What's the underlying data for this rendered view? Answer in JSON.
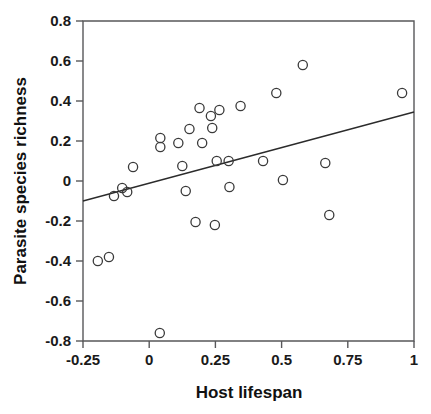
{
  "chart_data": {
    "type": "scatter",
    "title": "",
    "xlabel": "Host lifespan",
    "ylabel": "Parasite species richness",
    "xlim": [
      -0.25,
      1.0
    ],
    "ylim": [
      -0.8,
      0.8
    ],
    "xticks": [
      -0.25,
      0,
      0.25,
      0.5,
      0.75,
      1
    ],
    "xtick_labels": [
      "-0.25",
      "0",
      "0.25",
      "0.5",
      "0.75",
      "1"
    ],
    "yticks": [
      -0.8,
      -0.6,
      -0.4,
      -0.2,
      0,
      0.2,
      0.4,
      0.6,
      0.8
    ],
    "ytick_labels": [
      "-0.8",
      "-0.6",
      "-0.4",
      "-0.2",
      "0",
      "0.2",
      "0.4",
      "0.6",
      "0.8"
    ],
    "grid": false,
    "legend": null,
    "marker": "open-circle",
    "marker_color": "#3a3a3a",
    "points": [
      {
        "x": -0.194,
        "y": -0.4
      },
      {
        "x": -0.152,
        "y": -0.38
      },
      {
        "x": -0.133,
        "y": -0.075
      },
      {
        "x": -0.102,
        "y": -0.035
      },
      {
        "x": -0.083,
        "y": -0.055
      },
      {
        "x": -0.061,
        "y": 0.07
      },
      {
        "x": 0.04,
        "y": -0.76
      },
      {
        "x": 0.042,
        "y": 0.215
      },
      {
        "x": 0.042,
        "y": 0.17
      },
      {
        "x": 0.11,
        "y": 0.19
      },
      {
        "x": 0.125,
        "y": 0.075
      },
      {
        "x": 0.138,
        "y": -0.05
      },
      {
        "x": 0.152,
        "y": 0.26
      },
      {
        "x": 0.175,
        "y": -0.205
      },
      {
        "x": 0.19,
        "y": 0.365
      },
      {
        "x": 0.2,
        "y": 0.19
      },
      {
        "x": 0.233,
        "y": 0.325
      },
      {
        "x": 0.238,
        "y": 0.265
      },
      {
        "x": 0.248,
        "y": -0.22
      },
      {
        "x": 0.255,
        "y": 0.1
      },
      {
        "x": 0.265,
        "y": 0.355
      },
      {
        "x": 0.3,
        "y": 0.1
      },
      {
        "x": 0.303,
        "y": -0.03
      },
      {
        "x": 0.345,
        "y": 0.375
      },
      {
        "x": 0.43,
        "y": 0.1
      },
      {
        "x": 0.48,
        "y": 0.44
      },
      {
        "x": 0.505,
        "y": 0.005
      },
      {
        "x": 0.58,
        "y": 0.58
      },
      {
        "x": 0.665,
        "y": 0.09
      },
      {
        "x": 0.68,
        "y": -0.17
      },
      {
        "x": 0.955,
        "y": 0.44
      }
    ],
    "regression_line": {
      "x0": -0.25,
      "y0": -0.1,
      "x1": 1.0,
      "y1": 0.345,
      "color": "#2b2b2b"
    }
  },
  "colors": {
    "frame": "#58585a",
    "text": "#111111",
    "background": "#ffffff"
  }
}
